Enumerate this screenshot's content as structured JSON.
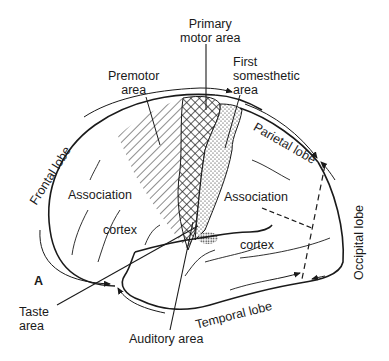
{
  "figure": {
    "panel_label": "A",
    "labels": {
      "primary_motor_line1": "Primary",
      "primary_motor_line2": "motor area",
      "premotor_line1": "Premotor",
      "premotor_line2": "area",
      "somesthetic_line1": "First",
      "somesthetic_line2": "somesthetic",
      "somesthetic_line3": "area",
      "parietal_lobe": "Parietal lobe",
      "frontal_lobe": "Frontal lobe",
      "occipital_lobe": "Occipital lobe",
      "temporal_lobe": "Temporal lobe",
      "association_frontal": "Association",
      "cortex_frontal": "cortex",
      "association_posterior": "Association",
      "cortex_posterior": "cortex",
      "taste_line1": "Taste",
      "taste_line2": "area",
      "auditory_area": "Auditory area"
    },
    "regions": [
      {
        "name": "Premotor area",
        "fill": "diagonal hatching"
      },
      {
        "name": "Primary motor area",
        "fill": "cross hatching"
      },
      {
        "name": "First somesthetic area",
        "fill": "stippled dots"
      },
      {
        "name": "Auditory area",
        "fill": "dense stipple"
      }
    ],
    "colors": {
      "ink": "#1a1a1a",
      "background": "#ffffff"
    }
  }
}
